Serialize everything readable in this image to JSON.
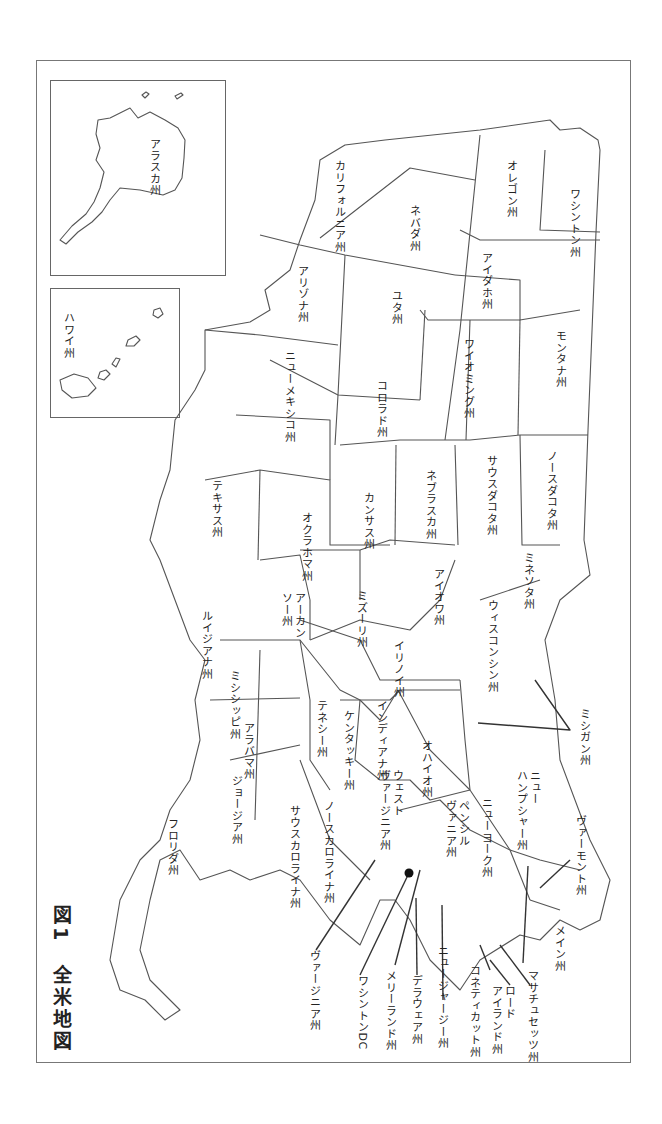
{
  "caption": {
    "figure_no": "図1",
    "title": "全米地図"
  },
  "insets": {
    "alaska": "アラスカ州",
    "hawaii": "ハワイ州"
  },
  "states": {
    "washington": "ワシントン州",
    "oregon": "オレゴン州",
    "california": "カリフォルニア州",
    "nevada": "ネバダ州",
    "idaho": "アイダホ州",
    "montana": "モンタナ州",
    "wyoming": "ワイオミング州",
    "utah": "ユタ州",
    "arizona": "アリゾナ州",
    "colorado": "コロラド州",
    "new_mexico": "ニューメキシコ州",
    "north_dakota": "ノースダコタ州",
    "south_dakota": "サウスダコタ州",
    "nebraska": "ネブラスカ州",
    "kansas": "カンサス州",
    "oklahoma": "オクラホマ州",
    "texas": "テキサス州",
    "minnesota": "ミネソタ州",
    "iowa": "アイオワ州",
    "missouri": "ミズーリ州",
    "arkansas": "アーカン\nソー州",
    "louisiana": "ルイジアナ州",
    "wisconsin": "ウィスコンシン州",
    "illinois": "イリノイ州",
    "michigan": "ミシガン州",
    "indiana": "インディアナ州",
    "ohio": "オハイオ州",
    "kentucky": "ケンタッキー州",
    "tennessee": "テネシー州",
    "mississippi": "ミシシッピ州",
    "alabama": "アラバマ州",
    "georgia": "ジョージア州",
    "florida": "フロリダ州",
    "south_carolina": "サウスカロライナ州",
    "north_carolina": "ノースカロライナ州",
    "west_virginia": "ウェスト\nヴァージニア州",
    "virginia": "ヴァージニア州",
    "pennsylvania": "ペンシル\nヴァニア州",
    "new_york": "ニューヨーク州",
    "vermont": "ヴァーモント州",
    "new_hampshire": "ニュー\nハンプシャー州",
    "maine": "メイン州",
    "massachusetts": "マサチュセッツ州",
    "rhode_island": "ロード\nアイランド州",
    "connecticut": "コネティカット州",
    "new_jersey": "ニュージャージー州",
    "delaware": "デラウェア州",
    "maryland": "メリーランド州",
    "washington_dc": "ワシントンDC"
  },
  "colors": {
    "line": "#555555",
    "text": "#222222",
    "background": "#ffffff"
  }
}
